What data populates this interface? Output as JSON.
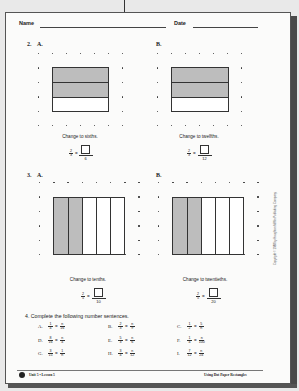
{
  "header": {
    "name_label": "Name",
    "date_label": "Date"
  },
  "section2": {
    "number": "2.",
    "A": {
      "label": "A.",
      "caption": "Change to sixths.",
      "fraction": {
        "num": "2",
        "den": "3"
      },
      "answer_den": "6",
      "rect": {
        "cols": 4,
        "rows": 3,
        "shaded_rows": 2
      }
    },
    "B": {
      "label": "B.",
      "caption": "Change to twelfths.",
      "fraction": {
        "num": "2",
        "den": "3"
      },
      "answer_den": "12",
      "rect": {
        "cols": 4,
        "rows": 3,
        "shaded_rows": 2
      }
    }
  },
  "section3": {
    "number": "3.",
    "A": {
      "label": "A.",
      "caption": "Change to tenths.",
      "fraction": {
        "num": "2",
        "den": "5"
      },
      "answer_den": "10",
      "rect": {
        "cols": 5,
        "rows": 4,
        "shaded_cols": 2
      }
    },
    "B": {
      "label": "B.",
      "caption": "Change to twentieths.",
      "fraction": {
        "num": "2",
        "den": "5"
      },
      "answer_den": "20",
      "rect": {
        "cols": 5,
        "rows": 4,
        "shaded_cols": 2
      }
    }
  },
  "section4": {
    "title": "4.  Complete the following number sentences.",
    "problems": [
      {
        "label": "A.",
        "ln": "1",
        "ld": "4",
        "rn": "n",
        "rd": "16"
      },
      {
        "label": "B.",
        "ln": "2",
        "ld": "3",
        "rn": "n",
        "rd": "9"
      },
      {
        "label": "C.",
        "ln": "1",
        "ld": "2",
        "rn": "5",
        "rd": "n"
      },
      {
        "label": "D.",
        "ln": "8",
        "ld": "16",
        "rn": "n",
        "rd": "4"
      },
      {
        "label": "E.",
        "ln": "5",
        "ld": "3",
        "rn": "n",
        "rd": "6"
      },
      {
        "label": "F.",
        "ln": "1",
        "ld": "4",
        "rn": "n",
        "rd": "100"
      },
      {
        "label": "G.",
        "ln": "3",
        "ld": "15",
        "rn": "1",
        "rd": "n"
      },
      {
        "label": "H.",
        "ln": "3",
        "ld": "4",
        "rn": "n",
        "rd": "12"
      },
      {
        "label": "I.",
        "ln": "7",
        "ld": "12",
        "rn": "n",
        "rd": "24"
      }
    ]
  },
  "copyright": "Copyright © 1988 by Houghton Mifflin Publishing Company",
  "footer": {
    "unit": "Unit 5  •  Lesson 5",
    "title": "Using Dot Paper Rectangles"
  }
}
